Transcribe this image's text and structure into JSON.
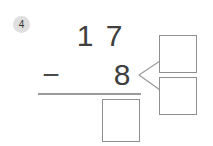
{
  "badge": {
    "number": "4"
  },
  "problem": {
    "minuend_tens": "1",
    "minuend_ones": "7",
    "operator": "−",
    "subtrahend_ones": "8",
    "answer_value": "",
    "bond_top_value": "",
    "bond_bottom_value": ""
  },
  "colors": {
    "digit": "#3f3f3f",
    "operator": "#4a4a4a",
    "line_and_borders": "#8f8f8f",
    "badge_bg": "#dfdfdf",
    "badge_text": "#333333",
    "background": "#ffffff"
  }
}
